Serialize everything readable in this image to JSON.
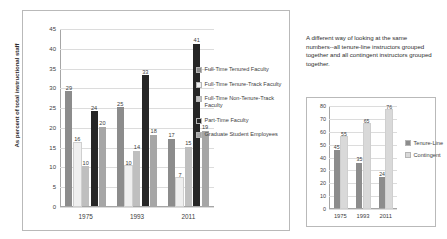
{
  "left": {
    "yaxis_title": "As percent of total instructional staff",
    "legend": [
      {
        "label": "Full-Time Tenured Faculty",
        "color": "#8c8c8c"
      },
      {
        "label": "Full-Time Tenure-Track Faculty",
        "color": "#efefef"
      },
      {
        "label": "Full-Time Non-Tenure-Track Faculty",
        "color": "#bfbfbf"
      },
      {
        "label": "Part-Time Faculty",
        "color": "#262626"
      },
      {
        "label": "Graduate Student Employees",
        "color": "#a6a6a6"
      }
    ]
  },
  "right": {
    "note": "A different way of looking at the same numbers--all tenure-line instructors grouped together and all contingent instructors grouped together.",
    "legend": [
      {
        "label": "Tenure-Line",
        "color": "#8c8c8c"
      },
      {
        "label": "Contingent",
        "color": "#d9d9d9"
      }
    ]
  },
  "chart_data": [
    {
      "type": "bar",
      "title": "",
      "xlabel": "",
      "ylabel": "As percent of total instructional staff",
      "ylim": [
        0,
        45
      ],
      "yticks": [
        0,
        5,
        10,
        15,
        20,
        25,
        30,
        35,
        40,
        45
      ],
      "grid": true,
      "legend_position": "right",
      "categories": [
        "1975",
        "1993",
        "2011"
      ],
      "series": [
        {
          "name": "Full-Time Tenured Faculty",
          "color": "#8c8c8c",
          "values": [
            29,
            25,
            17
          ]
        },
        {
          "name": "Full-Time Tenure-Track Faculty",
          "color": "#efefef",
          "values": [
            16,
            10,
            7
          ]
        },
        {
          "name": "Full-Time Non-Tenure-Track Faculty",
          "color": "#bfbfbf",
          "values": [
            10,
            14,
            15
          ]
        },
        {
          "name": "Part-Time Faculty",
          "color": "#262626",
          "values": [
            24,
            33,
            41
          ]
        },
        {
          "name": "Graduate Student Employees",
          "color": "#a6a6a6",
          "values": [
            20,
            18,
            19
          ]
        }
      ]
    },
    {
      "type": "bar",
      "title": "",
      "xlabel": "",
      "ylabel": "",
      "ylim": [
        0,
        80
      ],
      "yticks": [
        0,
        10,
        20,
        30,
        40,
        50,
        60,
        70,
        80
      ],
      "grid": true,
      "legend_position": "right",
      "categories": [
        "1975",
        "1993",
        "2011"
      ],
      "series": [
        {
          "name": "Tenure-Line",
          "color": "#8c8c8c",
          "values": [
            45,
            35,
            24
          ]
        },
        {
          "name": "Contingent",
          "color": "#d9d9d9",
          "values": [
            55,
            65,
            76
          ]
        }
      ]
    }
  ]
}
